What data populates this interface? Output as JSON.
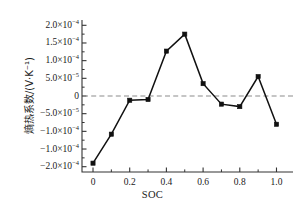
{
  "chart_data": {
    "type": "line",
    "title": "",
    "xlabel": "SOC",
    "ylabel": "熵热系数/(V·K⁻¹)",
    "x": [
      0,
      0.1,
      0.2,
      0.3,
      0.4,
      0.5,
      0.6,
      0.7,
      0.8,
      0.9,
      1.0
    ],
    "values": [
      -0.00019,
      -0.000108,
      -1.2e-05,
      -1e-05,
      0.000127,
      0.000175,
      3.5e-05,
      -2.3e-05,
      -3e-05,
      5.5e-05,
      -8e-05
    ],
    "series": [
      {
        "name": "熵热系数",
        "values": [
          -0.00019,
          -0.000108,
          -1.2e-05,
          -1e-05,
          0.000127,
          0.000175,
          3.5e-05,
          -2.3e-05,
          -3e-05,
          5.5e-05,
          -8e-05
        ]
      }
    ],
    "xlim": [
      -0.06,
      1.09
    ],
    "ylim": [
      -0.000215,
      0.000215
    ],
    "xticks": [
      0,
      0.2,
      0.4,
      0.6,
      0.8,
      1.0
    ],
    "xtick_labels": [
      "0",
      "0.2",
      "0.4",
      "0.6",
      "0.8",
      "1.0"
    ],
    "yticks": [
      0.0002,
      0.00015,
      0.0001,
      5e-05,
      0,
      -5e-05,
      -0.0001,
      -0.00015,
      -0.0002
    ],
    "ytick_labels": [
      "2.0×10⁻⁴",
      "1.5×10⁻⁴",
      "1.0×10⁻⁴",
      "5.0×10⁻⁵",
      "0",
      "−5.0×10⁻⁵",
      "−1.0×10⁻⁴",
      "−1.0×10⁻⁴",
      "−2.0×10⁻⁴"
    ],
    "minor_yticks_per_interval": 1,
    "minor_xticks_per_interval": 1,
    "grid": false,
    "zero_reference_line": true,
    "zero_line_style": "dashed",
    "zero_line_color": "#8c8c8c",
    "line_color": "#111111",
    "marker": "square",
    "marker_color": "#111111",
    "axis_color": "#333333",
    "legend": null,
    "legend_position": "none"
  },
  "ytick_labels_markup": [
    {
      "main": "2.0×10",
      "exp": "−4"
    },
    {
      "main": "1.5×10",
      "exp": "−4"
    },
    {
      "main": "1.0×10",
      "exp": "−4"
    },
    {
      "main": "5.0×10",
      "exp": "−5"
    },
    {
      "main": "0",
      "exp": ""
    },
    {
      "main": "−5.0×10",
      "exp": "−5"
    },
    {
      "main": "−1.0×10",
      "exp": "−4"
    },
    {
      "main": "−1.0×10",
      "exp": "−4"
    },
    {
      "main": "−2.0×10",
      "exp": "−4"
    }
  ],
  "axis_titles": {
    "x": "SOC",
    "y": "熵热系数/(V·K⁻¹)"
  }
}
